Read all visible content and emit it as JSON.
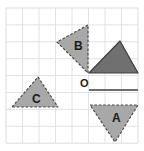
{
  "figure": {
    "canvas": {
      "width": 144,
      "height": 151,
      "background": "#ffffff"
    },
    "grid": {
      "name": "square-grid",
      "x_start": 6,
      "y_start": 8,
      "columns": 8,
      "rows": 8,
      "cell_width": 16.5,
      "cell_height": 16.9,
      "line_color": "#e2e2e2",
      "border_color": "#dcdcdc",
      "visible": true
    },
    "origin": {
      "name": "point-O",
      "label": "O",
      "x": 89,
      "y": 90,
      "label_x": 80,
      "label_y": 87,
      "font_size": 11
    },
    "shapes": [
      {
        "id": "triangle-shaded",
        "label": "",
        "role": "original",
        "fill": "#707070",
        "stroke": "#3c3c3c",
        "stroke_width": 1.2,
        "stroke_style": "solid",
        "points": "89,73 120,41 138,73",
        "vertices": [
          [
            89,
            73
          ],
          [
            120,
            41
          ],
          [
            138,
            73
          ]
        ]
      },
      {
        "id": "triangle-B",
        "label": "B",
        "role": "image-rotation-90-anticlockwise",
        "fill": "#a8a8a8",
        "stroke": "#4a4a4a",
        "stroke_width": 1.2,
        "stroke_style": "dashed",
        "points": "88,25 57,42 88,73",
        "vertices": [
          [
            88,
            25
          ],
          [
            57,
            42
          ],
          [
            88,
            73
          ]
        ],
        "label_x": 74,
        "label_y": 50,
        "font_size": 12
      },
      {
        "id": "triangle-C",
        "label": "C",
        "role": "image-rotation-180",
        "fill": "#a8a8a8",
        "stroke": "#4a4a4a",
        "stroke_width": 1.2,
        "stroke_style": "dashed",
        "points": "12,107 38,77 58,107",
        "vertices": [
          [
            12,
            107
          ],
          [
            38,
            77
          ],
          [
            58,
            107
          ]
        ],
        "label_x": 32,
        "label_y": 103,
        "font_size": 12
      },
      {
        "id": "triangle-A",
        "label": "A",
        "role": "image-rotation-90-clockwise",
        "fill": "#a8a8a8",
        "stroke": "#4a4a4a",
        "stroke_width": 1.2,
        "stroke_style": "dashed",
        "points": "90,105 138,105 115,142",
        "vertices": [
          [
            90,
            105
          ],
          [
            138,
            105
          ],
          [
            115,
            142
          ]
        ],
        "label_x": 112,
        "label_y": 122,
        "font_size": 12
      }
    ],
    "mirror_line": {
      "name": "horizontal-axis-segment",
      "x1": 89,
      "y1": 90,
      "x2": 138,
      "y2": 90,
      "color": "#6e6e6e",
      "width": 2.2
    }
  }
}
